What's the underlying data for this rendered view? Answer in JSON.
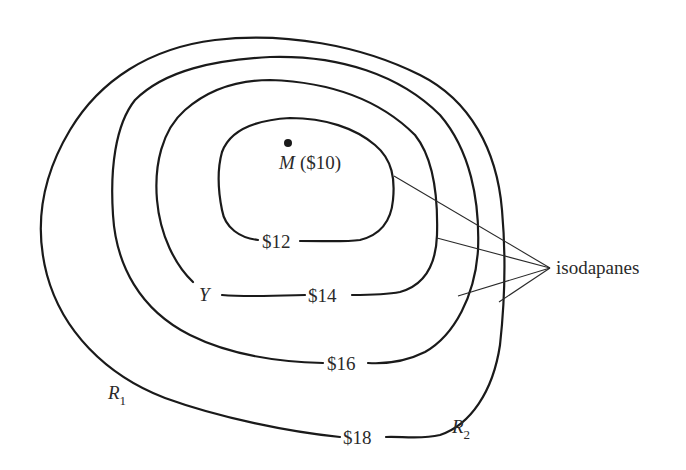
{
  "diagram": {
    "market_point": {
      "symbol": "M",
      "value_label": "($10)"
    },
    "isodapanes": [
      {
        "id": "c12",
        "label": "$12"
      },
      {
        "id": "c14",
        "label": "$14"
      },
      {
        "id": "c16",
        "label": "$16"
      },
      {
        "id": "c18",
        "label": "$18"
      }
    ],
    "point_labels": {
      "y": "Y",
      "r1": {
        "base": "R",
        "sub": "1"
      },
      "r2": {
        "base": "R",
        "sub": "2"
      }
    },
    "callout": {
      "text": "isodapanes"
    },
    "colors": {
      "line": "#1a1a1a",
      "text": "#2a2a2a",
      "background": "#ffffff"
    }
  }
}
